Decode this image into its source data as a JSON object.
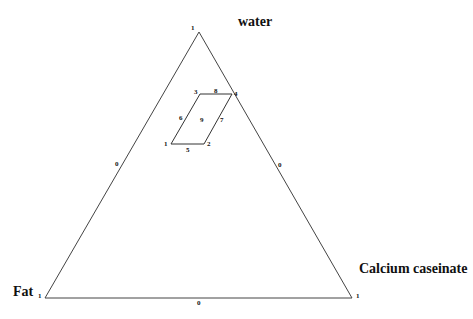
{
  "diagram": {
    "type": "ternary",
    "vertices": {
      "top": {
        "label": "water",
        "tick": "1"
      },
      "bottom_left": {
        "label": "Fat",
        "tick": "1"
      },
      "bottom_right": {
        "label": "Calcium caseinate",
        "tick": "1"
      }
    },
    "edge_ticks": {
      "left": "0",
      "right": "0",
      "bottom": "0"
    },
    "region_points": [
      {
        "id": "1",
        "label": "1"
      },
      {
        "id": "2",
        "label": "2"
      },
      {
        "id": "3",
        "label": "3"
      },
      {
        "id": "4",
        "label": "4"
      },
      {
        "id": "5",
        "label": "5"
      },
      {
        "id": "6",
        "label": "6"
      },
      {
        "id": "7",
        "label": "7"
      },
      {
        "id": "8",
        "label": "8"
      },
      {
        "id": "9",
        "label": "9"
      }
    ]
  }
}
